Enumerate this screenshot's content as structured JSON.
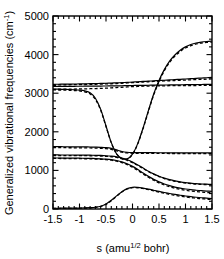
{
  "figure": {
    "background_color": "#ffffff",
    "line_color": "#000000",
    "frame_color": "#000000"
  },
  "axes": {
    "y_title_main": "Generalized vibrational frequencies (cm",
    "y_title_exponent": "-1",
    "y_title_close": ")",
    "x_title_main": "s (amu",
    "x_title_exponent": "1/2",
    "x_title_close": " bohr)",
    "x_ticks": [
      "-1.5",
      "-1",
      "-0.5",
      "0",
      "0.5",
      "1",
      "1.5"
    ],
    "y_ticks": [
      "0",
      "1000",
      "2000",
      "3000",
      "4000",
      "5000"
    ]
  },
  "chart_data": {
    "type": "line",
    "title": "",
    "xlabel": "s (amu^1/2 bohr)",
    "ylabel": "Generalized vibrational frequencies (cm^-1)",
    "xlim": [
      -1.5,
      1.5
    ],
    "ylim": [
      0,
      5000
    ],
    "grid": false,
    "legend": "none",
    "x_major_ticks": [
      -1.5,
      -1,
      -0.5,
      0,
      0.5,
      1,
      1.5
    ],
    "y_major_ticks": [
      0,
      1000,
      2000,
      3000,
      4000,
      5000
    ],
    "x_minor_tick_count_per_major": 5,
    "y_minor_tick_count_per_major": 5,
    "x": [
      -1.5,
      -1.4,
      -1.3,
      -1.2,
      -1.1,
      -1.0,
      -0.9,
      -0.8,
      -0.7,
      -0.6,
      -0.5,
      -0.4,
      -0.3,
      -0.2,
      -0.1,
      0.0,
      0.1,
      0.2,
      0.3,
      0.4,
      0.5,
      0.6,
      0.7,
      0.8,
      0.9,
      1.0,
      1.1,
      1.2,
      1.3,
      1.4,
      1.5
    ],
    "series": [
      {
        "name": "mode-1-solid",
        "style": "solid",
        "values": [
          3230,
          3232,
          3234,
          3236,
          3238,
          3240,
          3243,
          3246,
          3250,
          3254,
          3258,
          3263,
          3268,
          3274,
          3280,
          3288,
          3296,
          3304,
          3312,
          3320,
          3328,
          3336,
          3344,
          3352,
          3360,
          3368,
          3376,
          3384,
          3392,
          3400,
          3410
        ]
      },
      {
        "name": "mode-1-dashed",
        "style": "dashed",
        "values": [
          3215,
          3216,
          3218,
          3219,
          3221,
          3223,
          3225,
          3228,
          3231,
          3235,
          3240,
          3245,
          3251,
          3258,
          3266,
          3274,
          3282,
          3290,
          3297,
          3304,
          3311,
          3317,
          3323,
          3329,
          3335,
          3341,
          3347,
          3353,
          3359,
          3365,
          3372
        ]
      },
      {
        "name": "mode-2-solid",
        "style": "solid",
        "values": [
          3175,
          3176,
          3177,
          3178,
          3179,
          3180,
          3181,
          3182,
          3183,
          3185,
          3187,
          3189,
          3191,
          3193,
          3196,
          3199,
          3202,
          3204,
          3206,
          3208,
          3210,
          3212,
          3214,
          3216,
          3218,
          3220,
          3222,
          3224,
          3226,
          3228,
          3230
        ]
      },
      {
        "name": "mode-2-dashed",
        "style": "dashed",
        "values": [
          3100,
          3102,
          3104,
          3106,
          3108,
          3110,
          3113,
          3116,
          3120,
          3125,
          3131,
          3138,
          3146,
          3154,
          3162,
          3170,
          3176,
          3181,
          3185,
          3188,
          3190,
          3192,
          3194,
          3196,
          3197,
          3198,
          3199,
          3200,
          3201,
          3202,
          3203
        ]
      },
      {
        "name": "reactive-mode-solid",
        "style": "solid",
        "values": [
          3105,
          3103,
          3100,
          3096,
          3090,
          3080,
          3060,
          3010,
          2870,
          2580,
          2150,
          1720,
          1430,
          1310,
          1300,
          1420,
          1700,
          2100,
          2550,
          2980,
          3330,
          3610,
          3830,
          3990,
          4110,
          4200,
          4260,
          4300,
          4325,
          4340,
          4350
        ]
      },
      {
        "name": "reactive-mode-dashed",
        "style": "dashed",
        "values": [
          3085,
          3083,
          3080,
          3076,
          3070,
          3058,
          3035,
          2980,
          2840,
          2560,
          2140,
          1715,
          1425,
          1305,
          1295,
          1415,
          1690,
          2085,
          2530,
          2955,
          3300,
          3580,
          3800,
          3960,
          4080,
          4170,
          4230,
          4275,
          4300,
          4315,
          4325
        ]
      },
      {
        "name": "mode-3-solid",
        "style": "solid",
        "values": [
          1615,
          1614,
          1613,
          1612,
          1611,
          1610,
          1608,
          1606,
          1603,
          1598,
          1590,
          1570,
          1530,
          1490,
          1470,
          1462,
          1460,
          1459,
          1458,
          1458,
          1457,
          1457,
          1456,
          1456,
          1455,
          1455,
          1454,
          1454,
          1453,
          1453,
          1452
        ]
      },
      {
        "name": "mode-3-dashed",
        "style": "dashed",
        "values": [
          1590,
          1589,
          1588,
          1587,
          1586,
          1585,
          1583,
          1581,
          1578,
          1573,
          1565,
          1546,
          1508,
          1472,
          1452,
          1444,
          1442,
          1441,
          1440,
          1440,
          1439,
          1439,
          1438,
          1438,
          1437,
          1437,
          1436,
          1436,
          1435,
          1435,
          1434
        ]
      },
      {
        "name": "mode-4-solid",
        "style": "solid",
        "values": [
          1400,
          1400,
          1399,
          1399,
          1398,
          1397,
          1396,
          1394,
          1391,
          1387,
          1380,
          1368,
          1350,
          1320,
          1275,
          1215,
          1140,
          1060,
          980,
          910,
          850,
          800,
          760,
          728,
          702,
          682,
          668,
          656,
          648,
          642,
          638
        ]
      },
      {
        "name": "mode-4-dashed",
        "style": "dashed",
        "values": [
          1385,
          1385,
          1384,
          1384,
          1383,
          1382,
          1381,
          1379,
          1376,
          1372,
          1365,
          1353,
          1335,
          1305,
          1262,
          1202,
          1128,
          1048,
          970,
          900,
          840,
          790,
          750,
          718,
          692,
          672,
          658,
          646,
          638,
          632,
          628
        ]
      },
      {
        "name": "mode-5-solid",
        "style": "solid",
        "values": [
          1322,
          1321,
          1320,
          1319,
          1318,
          1316,
          1314,
          1311,
          1307,
          1301,
          1292,
          1278,
          1256,
          1222,
          1172,
          1105,
          1022,
          932,
          845,
          768,
          702,
          648,
          604,
          568,
          540,
          518,
          500,
          486,
          474,
          464,
          456
        ]
      },
      {
        "name": "mode-5-dashed",
        "style": "dashed",
        "values": [
          1310,
          1309,
          1308,
          1307,
          1306,
          1304,
          1302,
          1299,
          1295,
          1289,
          1280,
          1264,
          1240,
          1204,
          1152,
          1084,
          1000,
          910,
          822,
          744,
          678,
          622,
          576,
          540,
          510,
          486,
          466,
          450,
          438,
          428,
          420
        ]
      },
      {
        "name": "bend-mode-solid",
        "style": "solid",
        "values": [
          20,
          20,
          21,
          22,
          23,
          25,
          28,
          34,
          46,
          72,
          130,
          225,
          340,
          450,
          528,
          562,
          560,
          542,
          516,
          486,
          456,
          428,
          402,
          378,
          356,
          337,
          320,
          305,
          292,
          281,
          272
        ]
      },
      {
        "name": "bend-mode-dashed",
        "style": "dashed",
        "values": [
          15,
          15,
          16,
          17,
          18,
          20,
          23,
          29,
          41,
          66,
          122,
          216,
          330,
          440,
          518,
          552,
          550,
          530,
          502,
          470,
          438,
          408,
          380,
          354,
          332,
          312,
          295,
          280,
          267,
          256,
          247
        ]
      }
    ]
  }
}
